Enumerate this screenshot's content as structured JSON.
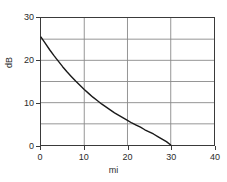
{
  "chart_data": {
    "type": "line",
    "title": "",
    "subtitle": "",
    "xlabel": "mi",
    "ylabel": "dB",
    "xlim": [
      0,
      40
    ],
    "ylim": [
      0,
      30
    ],
    "xticks": [
      0,
      10,
      20,
      30,
      40
    ],
    "xtick_labels": [
      "0",
      "10",
      "20",
      "30",
      "40"
    ],
    "yticks": [
      0,
      10,
      20,
      30
    ],
    "ytick_labels": [
      "0",
      "10",
      "20",
      "30"
    ],
    "y_gridlines": [
      0,
      5,
      10,
      15,
      20,
      25,
      30
    ],
    "x_gridlines": [
      0,
      10,
      20,
      30,
      40
    ],
    "grid": true,
    "legend": null,
    "legend_position": "none",
    "annotations": [],
    "series": [
      {
        "name": "attenuation",
        "color": "#1a1a1a",
        "line_width": 1.4,
        "x": [
          0,
          1,
          2,
          3,
          4,
          5,
          6,
          7,
          8,
          9,
          10,
          11,
          12,
          13,
          14,
          15,
          16,
          17,
          18,
          19,
          20,
          21,
          22,
          23,
          24,
          25,
          26,
          27,
          28,
          29,
          30
        ],
        "values": [
          25.5,
          24.0,
          22.5,
          21.1,
          19.8,
          18.5,
          17.3,
          16.2,
          15.1,
          14.1,
          13.1,
          12.2,
          11.3,
          10.5,
          9.7,
          9.0,
          8.3,
          7.6,
          7.0,
          6.4,
          5.8,
          5.2,
          4.7,
          4.2,
          3.6,
          3.1,
          2.6,
          2.0,
          1.4,
          0.8,
          0.0
        ]
      }
    ]
  },
  "figure": {
    "background_color": "#ffffff",
    "axis_color": "#3a3a3a",
    "grid_color": "#8a8a8a"
  }
}
